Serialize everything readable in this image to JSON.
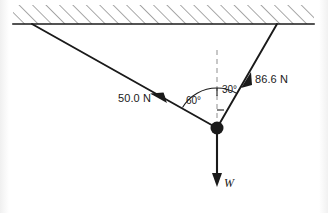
{
  "figure": {
    "background_color": "#ffffff",
    "line_color": "#1a1a1a",
    "hatch_color": "#8c8c8c",
    "dashed_color": "#9a9a9a",
    "knot_color": "#1a1a1a"
  },
  "labels": {
    "left_force": "50.0 N",
    "right_force": "86.6 N",
    "left_angle": "60°",
    "right_angle": "30°",
    "weight": "W"
  },
  "icons": {
    "ceiling": "hatched-ceiling-icon",
    "knot": "knot-node-icon",
    "left_arrow": "left-tension-arrow-icon",
    "right_arrow": "right-tension-arrow-icon",
    "weight_arrow": "weight-arrow-icon",
    "vertical_reference": "dashed-vertical-reference-icon",
    "left_arc": "angle-arc-60-icon",
    "right_arc": "angle-arc-30-icon"
  },
  "geometry": {
    "ceiling_y": 24,
    "ceiling_x_start": 13,
    "ceiling_x_end": 314,
    "knot_x": 217,
    "knot_y": 128,
    "knot_radius": 6.5,
    "left_anchor_x": 32,
    "left_anchor_y": 24,
    "right_anchor_x": 277,
    "right_anchor_y": 24,
    "weight_tip_y": 186,
    "dashed_top_y": 50
  }
}
